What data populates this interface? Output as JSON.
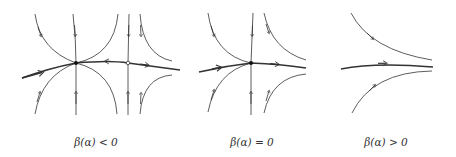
{
  "figure": {
    "line_color": "#333333",
    "background": "#ffffff"
  },
  "panels": [
    {
      "id": "beta-negative",
      "caption": "β(α) < 0",
      "caption_x": 96,
      "equilibria": [
        {
          "type": "saddle-stable-node",
          "marker": "filled",
          "x": 76,
          "y": 63
        },
        {
          "type": "saddle",
          "marker": "open",
          "x": 128,
          "y": 63
        }
      ]
    },
    {
      "id": "beta-zero",
      "caption": "β(α) = 0",
      "caption_x": 252,
      "equilibria": [
        {
          "type": "saddle-node",
          "marker": "filled",
          "x": 251,
          "y": 63
        }
      ]
    },
    {
      "id": "beta-positive",
      "caption": "β(α) > 0",
      "caption_x": 386,
      "equilibria": []
    }
  ]
}
